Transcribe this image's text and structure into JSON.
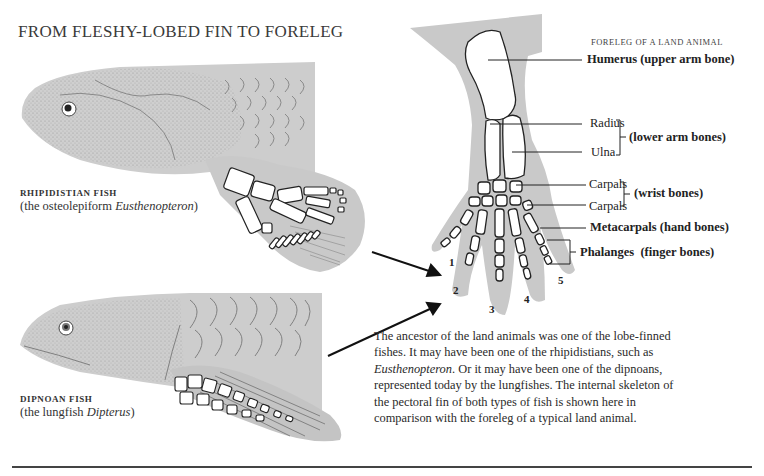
{
  "title": "FROM FLESHY-LOBED FIN TO FORELEG",
  "fish": [
    {
      "name": "RHIPIDISTIAN FISH",
      "sub_prefix": "(the osteolepiform ",
      "sub_italic": "Eusthenopteron",
      "sub_suffix": ")"
    },
    {
      "name": "DIPNOAN FISH",
      "sub_prefix": "(the lungfish ",
      "sub_italic": "Dipterus",
      "sub_suffix": ")"
    }
  ],
  "foreleg": {
    "title": "FORELEG OF A LAND ANIMAL",
    "labels": {
      "humerus": "Humerus (upper arm bone)",
      "radius": "Radius",
      "ulna": "Ulna",
      "lower_arm": "(lower arm bones)",
      "carpals_1": "Carpals",
      "carpals_2": "Carpals",
      "wrist": "(wrist bones)",
      "metacarpals": "Metacarpals (hand bones)",
      "phalanges": "Phalanges",
      "phalanges_note": "(finger bones)"
    },
    "digits": [
      "1",
      "2",
      "3",
      "4",
      "5"
    ]
  },
  "paragraph": {
    "part1": "The ancestor of the land animals was one of the lobe-finned fishes. It may have been one of the rhipidistians, such as ",
    "italic": "Eusthenopteron",
    "part2": ". Or it may have been one of the dipnoans, represented today by the lungfishes. The internal skeleton of the pectoral fin of both types of fish is shown here in comparison with the foreleg of a typical land animal."
  },
  "colors": {
    "shading": "#c8c8c8",
    "bone": "#ffffff",
    "ink": "#222222"
  }
}
